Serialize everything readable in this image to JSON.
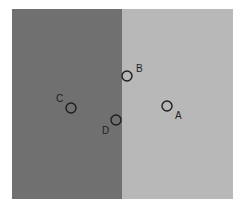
{
  "diagram": {
    "panels": [
      {
        "name": "dark-region",
        "color": "#707070"
      },
      {
        "name": "light-region",
        "color": "#b8b8b8"
      }
    ],
    "points": [
      {
        "label": "A",
        "cx": 167,
        "cy": 106,
        "lx": 175,
        "ly": 119
      },
      {
        "label": "B",
        "cx": 127,
        "cy": 76,
        "lx": 136,
        "ly": 72
      },
      {
        "label": "C",
        "cx": 71,
        "cy": 108,
        "lx": 56,
        "ly": 102
      },
      {
        "label": "D",
        "cx": 116,
        "cy": 120,
        "lx": 102,
        "ly": 134
      }
    ],
    "circle_radius": 5
  }
}
